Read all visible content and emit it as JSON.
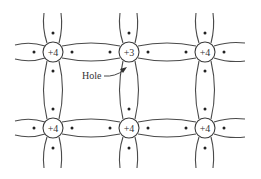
{
  "diagram": {
    "atoms": [
      {
        "id": "a00",
        "row": 0,
        "col": 0,
        "charge": "+4"
      },
      {
        "id": "a01",
        "row": 0,
        "col": 1,
        "charge": "+3"
      },
      {
        "id": "a02",
        "row": 0,
        "col": 2,
        "charge": "+4"
      },
      {
        "id": "a10",
        "row": 1,
        "col": 0,
        "charge": "+4"
      },
      {
        "id": "a11",
        "row": 1,
        "col": 1,
        "charge": "+4"
      },
      {
        "id": "a12",
        "row": 1,
        "col": 2,
        "charge": "+4"
      }
    ],
    "hole_label": "Hole",
    "colors": {
      "line": "#4a4a4a",
      "electron": "#222222",
      "background": "#ffffff"
    }
  }
}
